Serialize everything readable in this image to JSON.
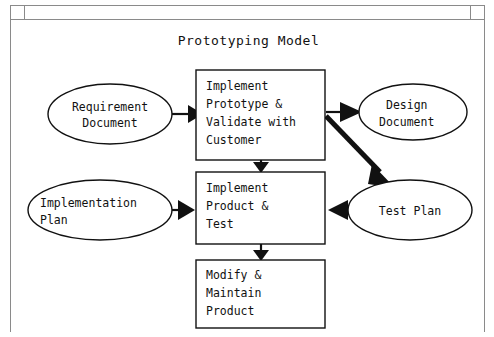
{
  "window": {
    "titlebar_button_left": "window-menu",
    "titlebar_button_right": "window-resize"
  },
  "diagram": {
    "title": "Prototyping Model",
    "type": "flowchart",
    "colors": {
      "background": "#ffffff",
      "stroke": "#111111",
      "chrome_border": "#8a8a8a"
    },
    "nodes": [
      {
        "id": "requirement-document",
        "shape": "ellipse",
        "label_lines": [
          "Requirement",
          "Document"
        ],
        "cx": 100,
        "cy": 94,
        "rx": 62,
        "ry": 30
      },
      {
        "id": "implement-prototype",
        "shape": "rect",
        "label_lines": [
          "Implement",
          "Prototype &",
          "Validate with",
          "Customer"
        ],
        "x": 186,
        "y": 50,
        "w": 129,
        "h": 90
      },
      {
        "id": "design-document",
        "shape": "ellipse",
        "label_lines": [
          "Design",
          "Document"
        ],
        "cx": 403,
        "cy": 92,
        "rx": 54,
        "ry": 28
      },
      {
        "id": "implementation-plan",
        "shape": "ellipse",
        "label_lines": [
          "Implementation",
          "Plan"
        ],
        "cx": 90,
        "cy": 190,
        "rx": 72,
        "ry": 30
      },
      {
        "id": "implement-product-test",
        "shape": "rect",
        "label_lines": [
          "Implement",
          "Product &",
          "Test"
        ],
        "x": 186,
        "y": 152,
        "w": 129,
        "h": 72
      },
      {
        "id": "test-plan",
        "shape": "ellipse",
        "label_lines": [
          "Test Plan"
        ],
        "cx": 400,
        "cy": 190,
        "rx": 62,
        "ry": 30
      },
      {
        "id": "modify-maintain-product",
        "shape": "rect",
        "label_lines": [
          "Modify &",
          "Maintain",
          "Product"
        ],
        "x": 186,
        "y": 240,
        "w": 129,
        "h": 68
      }
    ],
    "edges": [
      {
        "id": "requirement-to-prototype",
        "from": "requirement-document",
        "to": "implement-prototype",
        "style": "thin",
        "direction": "right"
      },
      {
        "id": "prototype-to-design",
        "from": "implement-prototype",
        "to": "design-document",
        "style": "thin",
        "direction": "right"
      },
      {
        "id": "prototype-to-testplan",
        "from": "implement-prototype",
        "to": "test-plan",
        "style": "thick",
        "direction": "diagonal-down-right"
      },
      {
        "id": "prototype-to-product",
        "from": "implement-prototype",
        "to": "implement-product-test",
        "style": "thin",
        "direction": "down"
      },
      {
        "id": "plan-to-product",
        "from": "implementation-plan",
        "to": "implement-product-test",
        "style": "thin",
        "direction": "right"
      },
      {
        "id": "testplan-to-product",
        "from": "test-plan",
        "to": "implement-product-test",
        "style": "thin",
        "direction": "left"
      },
      {
        "id": "product-to-modify",
        "from": "implement-product-test",
        "to": "modify-maintain-product",
        "style": "thin",
        "direction": "down"
      }
    ]
  }
}
